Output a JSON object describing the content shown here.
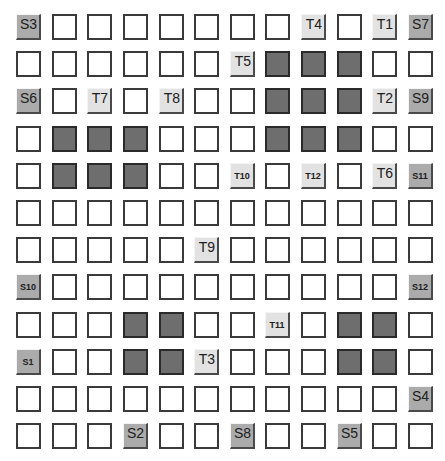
{
  "grid": {
    "rows": 12,
    "cols": 12,
    "colors": {
      "empty": "#ffffff",
      "obstacle": "#6e6e6e",
      "target": "#e2e2e2",
      "source": "#ababab"
    },
    "cells": [
      [
        "S3",
        "",
        "",
        "",
        "",
        "",
        "",
        "",
        "T4",
        "",
        "T1",
        "S7"
      ],
      [
        "",
        "",
        "",
        "",
        "",
        "",
        "T5",
        "#",
        "#",
        "#",
        "",
        ""
      ],
      [
        "S6",
        "",
        "T7",
        "",
        "T8",
        "",
        "",
        "#",
        "#",
        "#",
        "T2",
        "S9"
      ],
      [
        "",
        "#",
        "#",
        "#",
        "",
        "",
        "",
        "#",
        "#",
        "#",
        "",
        ""
      ],
      [
        "",
        "#",
        "#",
        "#",
        "",
        "",
        "T10",
        "",
        "T12",
        "",
        "T6",
        "S11"
      ],
      [
        "",
        "",
        "",
        "",
        "",
        "",
        "",
        "",
        "",
        "",
        "",
        ""
      ],
      [
        "",
        "",
        "",
        "",
        "",
        "T9",
        "",
        "",
        "",
        "",
        "",
        ""
      ],
      [
        "S10",
        "",
        "",
        "",
        "",
        "",
        "",
        "",
        "",
        "",
        "",
        "S12"
      ],
      [
        "",
        "",
        "",
        "#",
        "#",
        "",
        "",
        "T11",
        "",
        "#",
        "#",
        ""
      ],
      [
        "S1",
        "",
        "",
        "#",
        "#",
        "T3",
        "",
        "",
        "",
        "#",
        "#",
        ""
      ],
      [
        "",
        "",
        "",
        "",
        "",
        "",
        "",
        "",
        "",
        "",
        "",
        "S4"
      ],
      [
        "",
        "",
        "",
        "S2",
        "",
        "",
        "S8",
        "",
        "",
        "S5",
        "",
        ""
      ]
    ],
    "small_labels": [
      "T10",
      "T11",
      "T12",
      "S10",
      "S11",
      "S12",
      "S1"
    ]
  }
}
